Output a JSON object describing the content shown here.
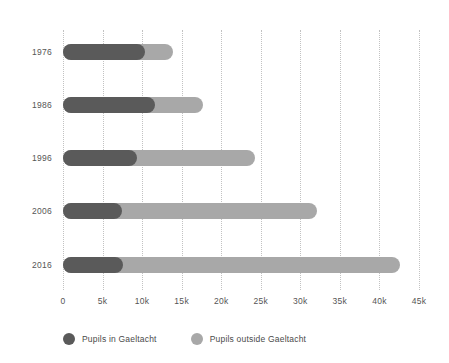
{
  "chart_data": {
    "type": "bar",
    "orientation": "horizontal",
    "stacked": true,
    "title": "",
    "subtitle": "",
    "xlabel": "",
    "ylabel": "",
    "categories": [
      "1976",
      "1986",
      "1996",
      "2006",
      "2016"
    ],
    "series": [
      {
        "name": "Pupils in Gaeltacht",
        "color": "#5a5a5a",
        "values": [
          10400,
          11600,
          9300,
          7400,
          7600
        ]
      },
      {
        "name": "Pupils outside Gaeltacht",
        "color": "#a8a8a8",
        "values": [
          3500,
          6100,
          15000,
          24700,
          35000
        ]
      }
    ],
    "totals": [
      13900,
      17700,
      24300,
      32100,
      42600
    ],
    "xlim": [
      0,
      45000
    ],
    "xticks": [
      0,
      5000,
      10000,
      15000,
      20000,
      25000,
      30000,
      35000,
      40000,
      45000
    ],
    "xtick_labels": [
      "0",
      "5k",
      "10k",
      "15k",
      "20k",
      "25k",
      "30k",
      "35k",
      "40k",
      "45k"
    ],
    "grid": "vertical-dotted",
    "legend_position": "bottom-left"
  },
  "legend": {
    "items": [
      {
        "label": "Pupils in Gaeltacht",
        "color": "#5a5a5a",
        "marker": "circle-dark"
      },
      {
        "label": "Pupils outside Gaeltacht",
        "color": "#a8a8a8",
        "marker": "circle-light"
      }
    ]
  },
  "colors": {
    "background": "#ffffff",
    "dark_series": "#5a5a5a",
    "light_series": "#a8a8a8",
    "gridline": "#c2c2c2",
    "text": "#555555"
  }
}
